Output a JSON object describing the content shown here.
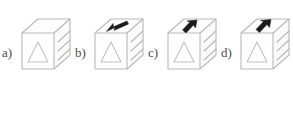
{
  "figure": {
    "background_color": "#ffffff",
    "line_color": "#b9b9b9",
    "arrow_color": "#1b1b1b",
    "label_color": "#4a4a4a",
    "options": [
      {
        "id": "a",
        "label": "a)",
        "front_symbol": "triangle-outline",
        "arrow": "none",
        "arrow_description": "no arrow on top face"
      },
      {
        "id": "b",
        "label": "b)",
        "front_symbol": "triangle-outline",
        "arrow": "down-left",
        "arrow_description": "black arrow on top face pointing down-left toward front-left edge"
      },
      {
        "id": "c",
        "label": "c)",
        "front_symbol": "triangle-outline",
        "arrow": "up-right",
        "arrow_description": "black arrow on top face pointing up-right toward back-right edge"
      },
      {
        "id": "d",
        "label": "d)",
        "front_symbol": "triangle-outline",
        "arrow": "up-right",
        "arrow_description": "black arrow on top face pointing up-right toward back-right edge"
      }
    ]
  }
}
